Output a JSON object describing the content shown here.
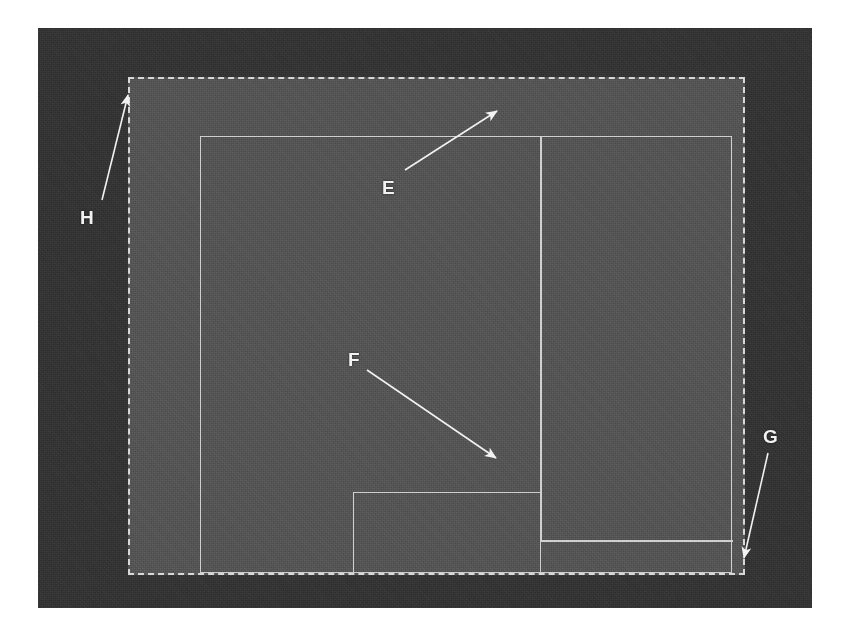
{
  "figure": {
    "type": "annotated-grayscale-micrograph-diagram",
    "background_color": "#ffffff",
    "outer_frame_color": "#353535",
    "inner_field_color": "#565656",
    "line_color": "#cfcfcf",
    "dashed_border_color": "#d8d8d8",
    "label_color": "#f2f2f2"
  },
  "callouts": [
    {
      "id": "E",
      "label": "E",
      "label_x": 382,
      "label_y": 178,
      "tail_x": 405,
      "tail_y": 170,
      "tip_x": 500,
      "tip_y": 108,
      "points_to": "top-right intersection of vertical divider and upper horizontal edge"
    },
    {
      "id": "F",
      "label": "F",
      "label_x": 348,
      "label_y": 350,
      "tail_x": 367,
      "tail_y": 370,
      "tip_x": 499,
      "tip_y": 460,
      "points_to": "intersection of vertical divider with lower horizontal edge and nested box corner"
    },
    {
      "id": "G",
      "label": "G",
      "label_x": 763,
      "label_y": 427,
      "tail_x": 768,
      "tail_y": 453,
      "tip_x": 742,
      "tip_y": 562,
      "points_to": "bottom-right corner of dashed boundary"
    },
    {
      "id": "H",
      "label": "H",
      "label_x": 80,
      "label_y": 208,
      "tail_x": 102,
      "tail_y": 200,
      "tip_x": 127,
      "tip_y": 90,
      "points_to": "top-left corner of dashed boundary"
    }
  ],
  "shapes": {
    "dashed_boundary": {
      "name": "dashed-boundary-rect",
      "x": 90,
      "y": 49,
      "width": 617,
      "height": 498
    },
    "main_rect": {
      "name": "main-solid-rect",
      "x": 70,
      "y": 57,
      "width": 532,
      "height": 437
    },
    "vertical_divider": {
      "name": "vertical-divider-line",
      "x": 410,
      "y": 57,
      "height": 404
    },
    "lower_horizontal": {
      "name": "lower-horizontal-line",
      "x": 410,
      "y": 461,
      "width": 192
    },
    "nested_box": {
      "name": "nested-small-rect",
      "x": 223,
      "y": 413,
      "width": 188,
      "height": 81
    }
  }
}
